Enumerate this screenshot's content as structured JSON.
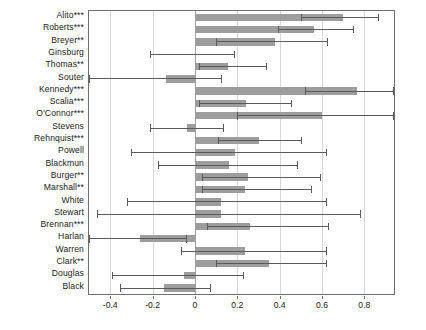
{
  "chart_data": {
    "type": "bar",
    "orientation": "horizontal",
    "title": "",
    "subtitle": "",
    "xlabel": "",
    "ylabel": "",
    "xlim": [
      -0.5,
      0.94
    ],
    "grid": true,
    "legend": null,
    "xticks": [
      -0.4,
      -0.2,
      0,
      0.2,
      0.4,
      0.6,
      0.8
    ],
    "xtick_labels": [
      "-0.4",
      "-0.2",
      "0",
      "0.2",
      "0.4",
      "0.6",
      "0.8"
    ],
    "categories": [
      "Alito***",
      "Roberts***",
      "Breyer**",
      "Ginsburg",
      "Thomas**",
      "Souter",
      "Kennedy***",
      "Scalia***",
      "O'Connor***",
      "Stevens",
      "Rehnquist***",
      "Powell",
      "Blackmun",
      "Burger**",
      "Marshall**",
      "White",
      "Stewart",
      "Brennan***",
      "Harlan",
      "Warren",
      "Clark**",
      "Douglas",
      "Black"
    ],
    "values": [
      0.7,
      0.56,
      0.38,
      0.0,
      0.155,
      -0.135,
      0.765,
      0.24,
      0.6,
      -0.035,
      0.305,
      0.19,
      0.16,
      0.25,
      0.235,
      0.125,
      0.125,
      0.26,
      -0.26,
      0.235,
      0.35,
      -0.05,
      -0.145
    ],
    "error_low": [
      0.5,
      0.39,
      0.1,
      -0.21,
      0.02,
      -0.5,
      0.52,
      0.02,
      0.2,
      -0.21,
      0.11,
      -0.3,
      -0.175,
      0.035,
      0.035,
      -0.32,
      -0.46,
      0.055,
      -0.5,
      -0.065,
      0.1,
      -0.39,
      -0.355
    ],
    "error_high": [
      0.865,
      0.745,
      0.625,
      0.185,
      0.335,
      0.125,
      0.935,
      0.455,
      0.935,
      0.135,
      0.5,
      0.62,
      0.48,
      0.59,
      0.55,
      0.62,
      0.78,
      0.63,
      -0.04,
      0.62,
      0.62,
      0.225,
      0.07
    ],
    "series": [
      {
        "name": "coefficient",
        "values": [
          0.7,
          0.56,
          0.38,
          0.0,
          0.155,
          -0.135,
          0.765,
          0.24,
          0.6,
          -0.035,
          0.305,
          0.19,
          0.16,
          0.25,
          0.235,
          0.125,
          0.125,
          0.26,
          -0.26,
          0.235,
          0.35,
          -0.05,
          -0.145
        ]
      }
    ],
    "bar_color": "#9d9d9d",
    "error_color": "#5a5a5a",
    "grid_color": "#d8d8d8",
    "zero_line_color": "#9f9f9f",
    "frame_color": "#6e6e6e"
  }
}
